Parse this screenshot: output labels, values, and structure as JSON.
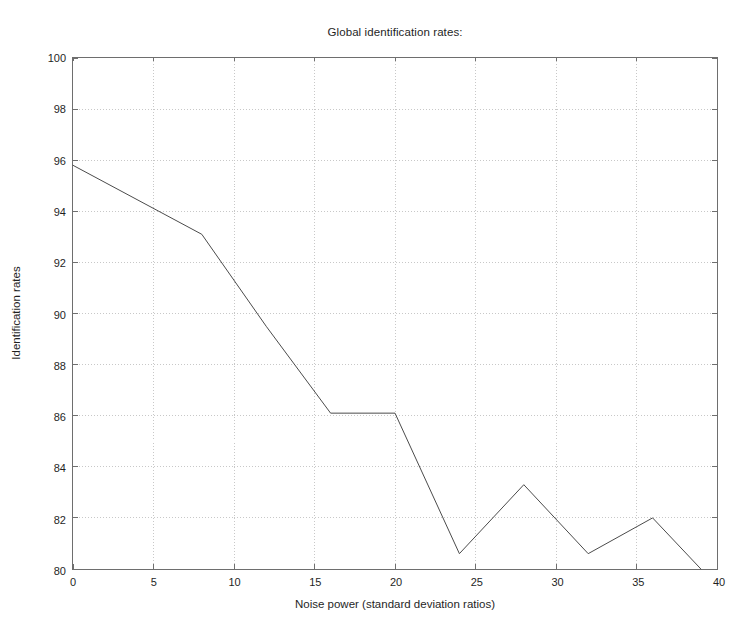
{
  "chart_data": {
    "type": "line",
    "title": "Global identification rates:",
    "xlabel": "Noise power (standard deviation ratios)",
    "ylabel": "Identification rates",
    "xlim": [
      0,
      40
    ],
    "ylim": [
      80,
      100
    ],
    "xticks": [
      0,
      5,
      10,
      15,
      20,
      25,
      30,
      35,
      40
    ],
    "yticks": [
      80,
      82,
      84,
      86,
      88,
      90,
      92,
      94,
      96,
      98,
      100
    ],
    "xtick_labels": [
      "0",
      "5",
      "10",
      "15",
      "20",
      "25",
      "30",
      "35",
      "40"
    ],
    "ytick_labels": [
      "80",
      "82",
      "84",
      "86",
      "88",
      "90",
      "92",
      "94",
      "96",
      "98",
      "100"
    ],
    "grid": true,
    "grid_style": "dotted",
    "legend": null,
    "series": [
      {
        "name": "Global identification rate",
        "color": "#4a4a4a",
        "line_width": 1,
        "marker": "none",
        "x": [
          0,
          8,
          12,
          16,
          20,
          24,
          28,
          32,
          36,
          39
        ],
        "y": [
          95.8,
          93.1,
          89.5,
          86.1,
          86.1,
          80.6,
          83.3,
          80.6,
          82.0,
          80.0
        ]
      }
    ],
    "annotations": []
  },
  "style": {
    "axis_color": "#6e6e6e",
    "grid_color": "#c8c8c8",
    "text_color": "#1f1f1f",
    "background": "#ffffff"
  }
}
